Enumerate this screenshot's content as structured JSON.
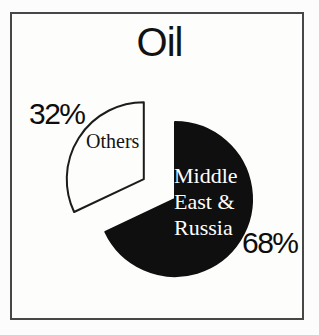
{
  "figure": {
    "background": "#fcfcfc",
    "frame_border_color": "#474747"
  },
  "chart_data": {
    "type": "pie",
    "title": "Oil",
    "start_angle_deg": 90,
    "direction": "clockwise",
    "legend": "none",
    "slices": [
      {
        "label": "Middle East & Russia",
        "value": 68,
        "pct_label": "68%",
        "color": "#0f0f0f",
        "stroke": "#0f0f0f",
        "text_color": "#ffffff",
        "exploded": false
      },
      {
        "label": "Others",
        "value": 32,
        "pct_label": "32%",
        "color": "#fdfdfc",
        "stroke": "#1c1c1c",
        "text_color": "#141414",
        "exploded": true
      }
    ]
  }
}
